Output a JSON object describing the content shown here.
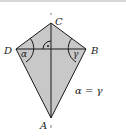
{
  "diagram": {
    "figure_type": "geometric-kite",
    "vertices": {
      "A": {
        "label": "A",
        "x": 51,
        "y": 118
      },
      "B": {
        "label": "B",
        "x": 86,
        "y": 49
      },
      "C": {
        "label": "C",
        "x": 51,
        "y": 23
      },
      "D": {
        "label": "D",
        "x": 16,
        "y": 49
      }
    },
    "angles": {
      "alpha": {
        "symbol": "α",
        "at": "D"
      },
      "gamma": {
        "symbol": "γ",
        "at": "B"
      }
    },
    "right_angle_marker": {
      "at": "diagonal intersection",
      "symbol": "·"
    },
    "equation": "α = γ",
    "colors": {
      "fill": "#c8c8c8",
      "stroke": "#1a1a1a",
      "background": "#ffffff",
      "top_border": "#d8d8d8"
    }
  }
}
